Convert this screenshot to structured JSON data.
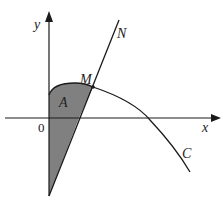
{
  "diagram": {
    "labels": {
      "y_axis": "y",
      "x_axis": "x",
      "origin": "0",
      "point_M": "M",
      "line_N": "N",
      "curve_C": "C",
      "region_A": "A"
    },
    "colors": {
      "stroke": "#1a1a1a",
      "shaded_region": "#808080",
      "background": "#ffffff"
    }
  }
}
